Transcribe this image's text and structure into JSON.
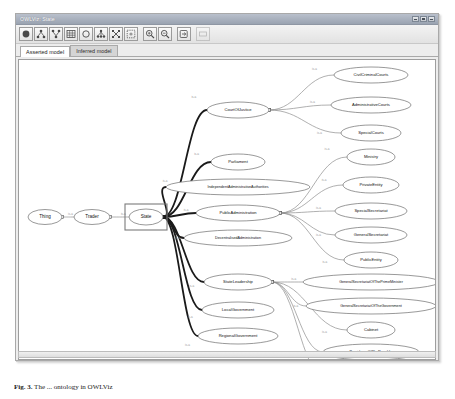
{
  "window": {
    "title": "OWLViz: State",
    "controls": [
      {
        "name": "minimize",
        "label": "Minimize"
      },
      {
        "name": "maximize",
        "label": "Maximize"
      },
      {
        "name": "close",
        "label": "Close"
      }
    ]
  },
  "toolbar": {
    "buttons": [
      {
        "name": "show-all-classes-icon",
        "label": "Show all classes"
      },
      {
        "name": "show-ancestors-icon",
        "label": "Show ancestors"
      },
      {
        "name": "show-descendants-icon",
        "label": "Show descendants"
      },
      {
        "name": "grid-layout-icon",
        "label": "Grid layout"
      },
      {
        "name": "show-class-icon",
        "label": "Show selected class"
      },
      {
        "name": "tree-layout-icon",
        "label": "Tree layout"
      },
      {
        "name": "radial-layout-icon",
        "label": "Radial layout"
      },
      {
        "name": "snapshot-icon",
        "label": "Snapshot"
      },
      {
        "name": "zoom-in-icon",
        "label": "Zoom in"
      },
      {
        "name": "zoom-out-icon",
        "label": "Zoom out"
      },
      {
        "name": "export-icon",
        "label": "Export"
      },
      {
        "name": "options-icon",
        "label": "Options"
      }
    ]
  },
  "tabs": [
    {
      "label": "Asserted model",
      "active": true
    },
    {
      "label": "Inferred model",
      "active": false
    }
  ],
  "graph": {
    "edge_label": "is-a",
    "selected_node": "State",
    "nodes": [
      {
        "id": "thing",
        "label": "Thing",
        "cx": 26,
        "cy": 157,
        "rx": 17,
        "ry": 7.5,
        "size": "normal"
      },
      {
        "id": "trader",
        "label": "Trader",
        "cx": 73,
        "cy": 157,
        "rx": 18,
        "ry": 7.5,
        "size": "normal"
      },
      {
        "id": "state",
        "label": "State",
        "cx": 127,
        "cy": 157,
        "rx": 17,
        "ry": 8,
        "size": "normal"
      },
      {
        "id": "courtofjustice",
        "label": "CourtOfJustice",
        "cx": 219,
        "cy": 50,
        "rx": 31,
        "ry": 8,
        "size": "small"
      },
      {
        "id": "civilcriminalcourts",
        "label": "CivilCriminalCourts",
        "cx": 352,
        "cy": 15,
        "rx": 37,
        "ry": 8,
        "size": "small"
      },
      {
        "id": "administrativecourts",
        "label": "AdministrativeCourts",
        "cx": 352,
        "cy": 45,
        "rx": 40,
        "ry": 8,
        "size": "small"
      },
      {
        "id": "specialcourts",
        "label": "SpecialCourts",
        "cx": 352,
        "cy": 73,
        "rx": 30,
        "ry": 8,
        "size": "small"
      },
      {
        "id": "parliament",
        "label": "Parliament",
        "cx": 219,
        "cy": 102,
        "rx": 27,
        "ry": 8,
        "size": "small"
      },
      {
        "id": "independentadministrativeauthorities",
        "label": "IndependentAdministrativeAuthorities",
        "cx": 219,
        "cy": 127,
        "rx": 72,
        "ry": 8,
        "size": "tiny"
      },
      {
        "id": "publicadministration",
        "label": "PublicAdministration",
        "cx": 219,
        "cy": 153,
        "rx": 42,
        "ry": 8,
        "size": "small"
      },
      {
        "id": "decentralisedadministration",
        "label": "DecentralisedAdministration",
        "cx": 219,
        "cy": 178,
        "rx": 54,
        "ry": 8,
        "size": "tiny"
      },
      {
        "id": "ministry",
        "label": "Ministry",
        "cx": 352,
        "cy": 97,
        "rx": 24,
        "ry": 8,
        "size": "small"
      },
      {
        "id": "privateentity",
        "label": "PrivateEntity",
        "cx": 352,
        "cy": 125,
        "rx": 28,
        "ry": 8,
        "size": "small"
      },
      {
        "id": "specialsecretariat",
        "label": "SpecialSecretariat",
        "cx": 352,
        "cy": 151,
        "rx": 36,
        "ry": 8,
        "size": "small"
      },
      {
        "id": "generalsecretariat",
        "label": "GeneralSecretariat",
        "cx": 352,
        "cy": 175,
        "rx": 36,
        "ry": 8,
        "size": "small"
      },
      {
        "id": "publicentity",
        "label": "PublicEntity",
        "cx": 352,
        "cy": 200,
        "rx": 27,
        "ry": 8,
        "size": "small"
      },
      {
        "id": "stateleadership",
        "label": "StateLeadership",
        "cx": 219,
        "cy": 222,
        "rx": 34,
        "ry": 8,
        "size": "small"
      },
      {
        "id": "localgovernment",
        "label": "LocalGovernment",
        "cx": 219,
        "cy": 250,
        "rx": 36,
        "ry": 8,
        "size": "small"
      },
      {
        "id": "regionalgovernment",
        "label": "RegionalGovernment",
        "cx": 219,
        "cy": 276,
        "rx": 40,
        "ry": 8,
        "size": "small"
      },
      {
        "id": "generalsecretariatoftheprimeminister",
        "label": "GeneralSecretariatOfThePrimeMinister",
        "cx": 352,
        "cy": 222,
        "rx": 68,
        "ry": 8,
        "size": "tiny"
      },
      {
        "id": "generalsecretariatofthegovernment",
        "label": "GeneralSecretariatOfTheGovernment",
        "cx": 352,
        "cy": 246,
        "rx": 65,
        "ry": 8,
        "size": "tiny"
      },
      {
        "id": "cabinet",
        "label": "Cabinet",
        "cx": 352,
        "cy": 270,
        "rx": 24,
        "ry": 8,
        "size": "small"
      },
      {
        "id": "presidencyoftherepublic",
        "label": "PresidencyOfTheRepublic",
        "cx": 352,
        "cy": 292,
        "rx": 48,
        "ry": 8,
        "size": "tiny"
      },
      {
        "id": "secretariatcoordination",
        "label": "SecretariatCoordination",
        "cx": 352,
        "cy": 315,
        "rx": 47,
        "ry": 8,
        "size": "tiny"
      }
    ],
    "edges": [
      {
        "from": "thing",
        "to": "trader",
        "style": "thin"
      },
      {
        "from": "trader",
        "to": "state",
        "style": "thin"
      },
      {
        "from": "state",
        "to": "courtofjustice",
        "style": "thick"
      },
      {
        "from": "state",
        "to": "parliament",
        "style": "thick"
      },
      {
        "from": "state",
        "to": "independentadministrativeauthorities",
        "style": "thick"
      },
      {
        "from": "state",
        "to": "publicadministration",
        "style": "thick"
      },
      {
        "from": "state",
        "to": "decentralisedadministration",
        "style": "thick"
      },
      {
        "from": "state",
        "to": "stateleadership",
        "style": "thick"
      },
      {
        "from": "state",
        "to": "localgovernment",
        "style": "thick"
      },
      {
        "from": "state",
        "to": "regionalgovernment",
        "style": "thick"
      },
      {
        "from": "courtofjustice",
        "to": "civilcriminalcourts",
        "style": "thin"
      },
      {
        "from": "courtofjustice",
        "to": "administrativecourts",
        "style": "thin"
      },
      {
        "from": "courtofjustice",
        "to": "specialcourts",
        "style": "thin"
      },
      {
        "from": "publicadministration",
        "to": "ministry",
        "style": "thin"
      },
      {
        "from": "publicadministration",
        "to": "privateentity",
        "style": "thin"
      },
      {
        "from": "publicadministration",
        "to": "specialsecretariat",
        "style": "thin"
      },
      {
        "from": "publicadministration",
        "to": "generalsecretariat",
        "style": "thin"
      },
      {
        "from": "publicadministration",
        "to": "publicentity",
        "style": "thin"
      },
      {
        "from": "stateleadership",
        "to": "generalsecretariatoftheprimeminister",
        "style": "thin"
      },
      {
        "from": "stateleadership",
        "to": "generalsecretariatofthegovernment",
        "style": "thin"
      },
      {
        "from": "stateleadership",
        "to": "cabinet",
        "style": "thin"
      },
      {
        "from": "stateleadership",
        "to": "presidencyoftherepublic",
        "style": "thin"
      },
      {
        "from": "stateleadership",
        "to": "secretariatcoordination",
        "style": "thin"
      }
    ]
  },
  "caption": {
    "figure_number": "Fig. 3.",
    "text": "The ... ontology in OWLViz"
  },
  "colors": {
    "titlebar": "#a8b0bd",
    "window_bg": "#ededed",
    "canvas_bg": "#ffffff",
    "node_stroke": "#6d6d6d",
    "thick_edge": "#1a1a1a",
    "thin_edge": "#8e8e8e",
    "tab_active_bg": "#ffffff",
    "tab_inactive_bg": "#d5d5d5"
  }
}
